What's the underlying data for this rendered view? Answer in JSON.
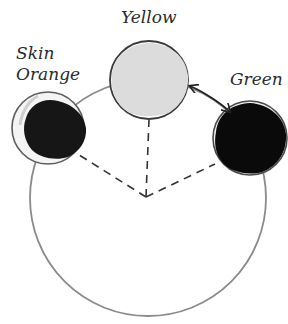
{
  "diagram": {
    "type": "color-wheel-harmony",
    "swatches": [
      {
        "id": "yellow",
        "label": "Yellow",
        "fill": "#dcdcdc",
        "cx": 149,
        "cy": 80,
        "r": 39
      },
      {
        "id": "skin-orange",
        "label_line1": "Skin",
        "label_line2": "Orange",
        "fill": "#161616",
        "cx": 48,
        "cy": 128,
        "r": 36
      },
      {
        "id": "green",
        "label": "Green",
        "fill": "#0a0a0a",
        "cx": 250,
        "cy": 138,
        "r": 37
      }
    ],
    "wheel": {
      "cx": 148,
      "cy": 198,
      "r": 118,
      "stroke": "#808080"
    },
    "apex": {
      "x": 146,
      "y": 197
    },
    "connector": {
      "from": "yellow",
      "to": "green",
      "style": "double-arrow"
    }
  },
  "labels": {
    "yellow": "Yellow",
    "skin": "Skin",
    "orange": "Orange",
    "green": "Green"
  }
}
